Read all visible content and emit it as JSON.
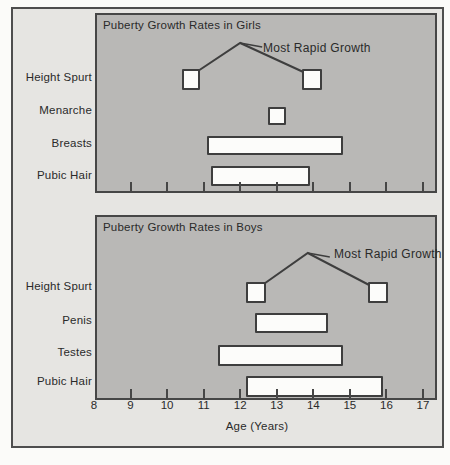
{
  "chart_data": [
    {
      "type": "bar",
      "variant": "horizontal-range",
      "title": "Puberty Growth Rates in Girls",
      "annotation": "Most Rapid Growth",
      "peak_age": 12.0,
      "xlabel": "Age (Years)",
      "xlim": [
        8,
        17.4
      ],
      "xticks": [
        8,
        9,
        10,
        11,
        12,
        13,
        14,
        15,
        16,
        17
      ],
      "grid": false,
      "categories": [
        "Height Spurt",
        "Menarche",
        "Breasts",
        "Pubic Hair"
      ],
      "series": [
        {
          "name": "Height Spurt",
          "segments": [
            [
              10.4,
              10.9
            ],
            [
              13.7,
              14.25
            ]
          ]
        },
        {
          "name": "Menarche",
          "segments": [
            [
              12.75,
              13.25
            ]
          ]
        },
        {
          "name": "Breasts",
          "segments": [
            [
              11.1,
              14.8
            ]
          ]
        },
        {
          "name": "Pubic Hair",
          "segments": [
            [
              11.2,
              13.9
            ]
          ]
        }
      ]
    },
    {
      "type": "bar",
      "variant": "horizontal-range",
      "title": "Puberty Growth Rates in Boys",
      "annotation": "Most Rapid Growth",
      "peak_age": 13.85,
      "xlabel": "Age (Years)",
      "xlim": [
        8,
        17.4
      ],
      "xticks": [
        8,
        9,
        10,
        11,
        12,
        13,
        14,
        15,
        16,
        17
      ],
      "grid": false,
      "categories": [
        "Height Spurt",
        "Penis",
        "Testes",
        "Pubic Hair"
      ],
      "series": [
        {
          "name": "Height Spurt",
          "segments": [
            [
              12.15,
              12.7
            ],
            [
              15.5,
              16.05
            ]
          ]
        },
        {
          "name": "Penis",
          "segments": [
            [
              12.4,
              14.4
            ]
          ]
        },
        {
          "name": "Testes",
          "segments": [
            [
              11.4,
              14.8
            ]
          ]
        },
        {
          "name": "Pubic Hair",
          "segments": [
            [
              12.15,
              15.9
            ]
          ]
        }
      ]
    }
  ],
  "colors": {
    "page_bg": "#fbfbf9",
    "mat_bg": "#e6e5e2",
    "panel_bg": "#b9b8b6",
    "bar_fill": "#fcfcfa",
    "line": "#3e3e3e",
    "text": "#2a2a2a"
  }
}
